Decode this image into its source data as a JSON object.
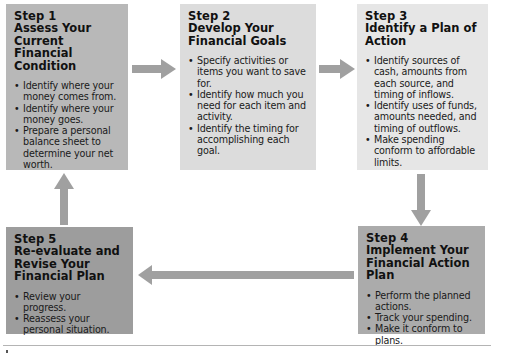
{
  "colors": {
    "step1_bg": "#b8b8b8",
    "step2_bg": "#dcdcdc",
    "step3_bg": "#e6e6e6",
    "step4_bg": "#ababab",
    "step5_bg": "#9d9d9d",
    "arrow": "#a0a0a0"
  },
  "steps": [
    {
      "number": "Step 1",
      "title": "Assess Your Current Financial Condition",
      "bullets": [
        "Identify where your money comes from.",
        "Identify where your money goes.",
        "Prepare a personal balance sheet to determine your net worth."
      ]
    },
    {
      "number": "Step 2",
      "title": "Develop Your Financial Goals",
      "bullets": [
        "Specify activities or items you want to save for.",
        "Identify how much you need for each item and activity.",
        "Identify the timing for accomplishing each goal."
      ]
    },
    {
      "number": "Step 3",
      "title": "Identify a Plan of Action",
      "bullets": [
        "Identify sources of cash, amounts from each source, and timing of inflows.",
        "Identify uses of funds, amounts needed, and timing of outflows.",
        "Make spending conform to affordable limits."
      ]
    },
    {
      "number": "Step 4",
      "title": "Implement Your Financial Action Plan",
      "bullets": [
        "Perform the planned actions.",
        "Track your spending.",
        "Make it conform to plans."
      ]
    },
    {
      "number": "Step 5",
      "title": "Re-evaluate and Revise Your Financial Plan",
      "bullets": [
        "Review your progress.",
        "Reassess your personal situation."
      ]
    }
  ],
  "arrows": [
    {
      "from": "Step 1",
      "to": "Step 2",
      "direction": "right"
    },
    {
      "from": "Step 2",
      "to": "Step 3",
      "direction": "right"
    },
    {
      "from": "Step 3",
      "to": "Step 4",
      "direction": "down"
    },
    {
      "from": "Step 4",
      "to": "Step 5",
      "direction": "left"
    },
    {
      "from": "Step 5",
      "to": "Step 1",
      "direction": "up"
    }
  ]
}
